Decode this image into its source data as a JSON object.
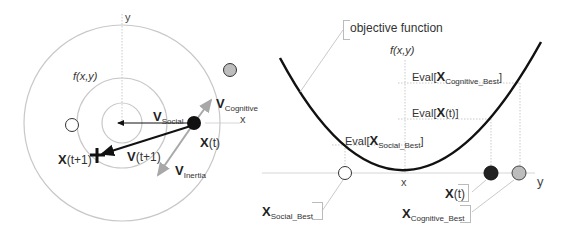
{
  "left_panel": {
    "title_func": "f(x,y)",
    "axis_x": "x",
    "axis_y": "y",
    "labels": {
      "v_cognitive_main": "V",
      "v_cognitive_sub": "Cognitive",
      "v_social_main": "V",
      "v_social_sub": "Social",
      "x_t": "X(t)",
      "x_t_main": "X",
      "x_t_suffix": "(t)",
      "x_t1_main": "X",
      "x_t1_suffix": "(t+1)",
      "v_t1_main": "V",
      "v_t1_suffix": "(t+1)",
      "v_inertia_main": "V",
      "v_inertia_sub": "Inertia"
    },
    "points": {
      "current_particle": {
        "fill": "#111111"
      },
      "cognitive_best": {
        "fill": "#bdbdbd"
      },
      "social_best": {
        "fill": "#ffffff"
      },
      "next_position": {
        "marker": "cross"
      }
    }
  },
  "right_panel": {
    "objective_label": "objective function",
    "func_label": "f(x,y)",
    "axis_x": "x",
    "axis_y": "y",
    "evals": {
      "cognitive_prefix": "Eval[",
      "cognitive_main": "X",
      "cognitive_sub": "Cognitive_Best",
      "cognitive_suffix": "]",
      "xt_prefix": "Eval[",
      "xt_main": "X",
      "xt_suffix": "(t)]",
      "social_prefix": "Eval[",
      "social_main": "X",
      "social_sub": "Social_Best",
      "social_suffix": "]"
    },
    "callouts": {
      "xt_main": "X",
      "xt_suffix": "(t)",
      "cog_main": "X",
      "cog_sub": "Cognitive_Best",
      "soc_main": "X",
      "soc_sub": "Social_Best"
    }
  },
  "colors": {
    "line_gray": "#c8c8c8",
    "arrow_gray": "#a8a8a8",
    "dark": "#111111",
    "dot_gray": "#bdbdbd"
  }
}
